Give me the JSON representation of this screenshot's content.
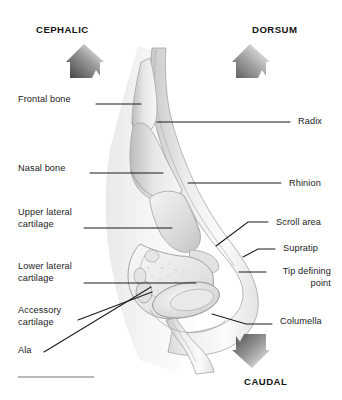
{
  "figure": {
    "background_color": "#ffffff",
    "width": 342,
    "height": 400
  },
  "orientation_markers": [
    {
      "id": "cephalic",
      "label": "CEPHALIC",
      "direction": "up",
      "arrow_icon": "arrow-up-banner",
      "x": 36,
      "y": 24,
      "arrow_x": 66,
      "arrow_y": 44
    },
    {
      "id": "dorsum",
      "label": "DORSUM",
      "direction": "up",
      "arrow_icon": "arrow-up-banner",
      "x": 252,
      "y": 24,
      "arrow_x": 234,
      "arrow_y": 44
    },
    {
      "id": "caudal",
      "label": "CAUDAL",
      "direction": "down",
      "arrow_icon": "arrow-down-banner",
      "x": 244,
      "y": 376,
      "arrow_x": 236,
      "arrow_y": 332
    }
  ],
  "left_labels": [
    {
      "id": "frontal-bone",
      "text": "Frontal bone",
      "x": 18,
      "y": 94
    },
    {
      "id": "nasal-bone",
      "text": "Nasal bone",
      "x": 18,
      "y": 163
    },
    {
      "id": "upper-lateral-cartilage",
      "text": "Upper lateral\ncartilage",
      "x": 18,
      "y": 207
    },
    {
      "id": "lower-lateral-cartilage",
      "text": "Lower lateral\ncartilage",
      "x": 18,
      "y": 261
    },
    {
      "id": "accessory-cartilage",
      "text": "Accessory\ncartilage",
      "x": 18,
      "y": 305
    },
    {
      "id": "ala",
      "text": "Ala",
      "x": 18,
      "y": 345
    }
  ],
  "right_labels": [
    {
      "id": "radix",
      "text": "Radix",
      "x": 298,
      "y": 116
    },
    {
      "id": "rhinion",
      "text": "Rhinion",
      "x": 289,
      "y": 178
    },
    {
      "id": "scroll-area",
      "text": "Scroll area",
      "x": 276,
      "y": 217
    },
    {
      "id": "supratip",
      "text": "Supratip",
      "x": 283,
      "y": 243
    },
    {
      "id": "tip-defining-point",
      "text": "Tip defining\npoint",
      "x": 273,
      "y": 266
    },
    {
      "id": "columella",
      "text": "Columella",
      "x": 280,
      "y": 316
    }
  ],
  "leader_lines": [
    {
      "id": "leader-frontal-bone",
      "from": [
        96,
        104
      ],
      "to": [
        141,
        104
      ]
    },
    {
      "id": "leader-nasal-bone",
      "from": [
        90,
        173
      ],
      "to": [
        163,
        173
      ]
    },
    {
      "id": "leader-upper-lateral-cartilage",
      "from": [
        84,
        228
      ],
      "to": [
        172,
        228
      ]
    },
    {
      "id": "leader-lower-lateral-cartilage",
      "from": [
        84,
        283
      ],
      "to": [
        196,
        283
      ]
    },
    {
      "id": "leader-accessory-cartilage",
      "from": [
        78,
        320
      ],
      "to": [
        152,
        292
      ]
    },
    {
      "id": "leader-ala",
      "from": [
        44,
        352
      ],
      "to": [
        151,
        287
      ]
    },
    {
      "id": "leader-radix",
      "from": [
        157,
        122
      ],
      "to": [
        290,
        122
      ]
    },
    {
      "id": "leader-rhinion",
      "from": [
        188,
        183
      ],
      "to": [
        281,
        183
      ]
    },
    {
      "id": "leader-scroll-area",
      "from": [
        216,
        246
      ],
      "to": [
        248,
        222
      ],
      "elbow": [
        268,
        222
      ]
    },
    {
      "id": "leader-supratip",
      "from": [
        243,
        257
      ],
      "to": [
        258,
        249
      ],
      "elbow": [
        275,
        249
      ]
    },
    {
      "id": "leader-tip-defining-point",
      "from": [
        239,
        272
      ],
      "to": [
        266,
        272
      ]
    },
    {
      "id": "leader-columella",
      "from": [
        212,
        314
      ],
      "to": [
        246,
        324
      ],
      "elbow": [
        272,
        324
      ]
    }
  ],
  "colors": {
    "line": "#1b1b1b",
    "label_text": "#1b1b1b",
    "orientation_text": "#141414",
    "cartilage_fill": "#dcdcdc",
    "bone_fill": "#e8e8e8",
    "skin_fill": "#f1f1f1",
    "outline": "#8d8d8d",
    "arrow_dark": "#4a4a4a",
    "arrow_light": "#fdfdfd",
    "footer_rule": "#b9b9b9"
  }
}
